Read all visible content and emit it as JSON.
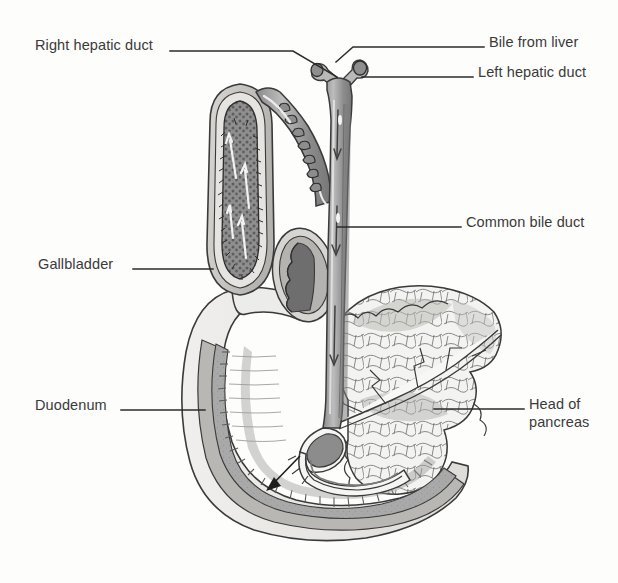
{
  "figure": {
    "style": "grayscale line-and-wash medical illustration",
    "background_color": "#fdfdfc",
    "ink_color": "#3a3a3a",
    "line_color": "#2b2b2b"
  },
  "labels": [
    {
      "id": "right-hepatic-duct",
      "text": "Right hepatic duct",
      "side": "left",
      "text_x": 35,
      "text_y": 36,
      "leader": "M 170 51 L 293 51 L 337 77"
    },
    {
      "id": "bile-from-liver",
      "text": "Bile from liver",
      "side": "right",
      "text_x": 489,
      "text_y": 33,
      "leader": "M 484 47 L 353 47 L 336 62"
    },
    {
      "id": "left-hepatic-duct",
      "text": "Left hepatic duct",
      "side": "right",
      "text_x": 478,
      "text_y": 63,
      "leader": "M 473 77 L 362 77"
    },
    {
      "id": "common-bile-duct",
      "text": "Common bile duct",
      "side": "right",
      "text_x": 466,
      "text_y": 213,
      "leader": "M 461 227 L 337 227"
    },
    {
      "id": "gallbladder",
      "text": "Gallbladder",
      "side": "left",
      "text_x": 38,
      "text_y": 255,
      "leader": "M 133 269 L 213 269"
    },
    {
      "id": "duodenum",
      "text": "Duodenum",
      "side": "left",
      "text_x": 35,
      "text_y": 396,
      "leader": "M 121 410 L 205 410"
    },
    {
      "id": "head-of-pancreas",
      "text": "Head of\npancreas",
      "side": "right",
      "text_x": 529,
      "text_y": 395,
      "leader": "M 524 409 L 434 409"
    }
  ],
  "structures": [
    {
      "id": "gallbladder-body",
      "name": "Gallbladder (cut open)"
    },
    {
      "id": "gallbladder-mucosa",
      "name": "Gallbladder mucosa"
    },
    {
      "id": "cystic-duct",
      "name": "Cystic duct with spiral valve"
    },
    {
      "id": "right-hepatic-duct-branch",
      "name": "Right hepatic duct"
    },
    {
      "id": "left-hepatic-duct-branch",
      "name": "Left hepatic duct"
    },
    {
      "id": "common-hepatic-duct",
      "name": "Common hepatic duct"
    },
    {
      "id": "common-bile-duct-tube",
      "name": "Common bile duct"
    },
    {
      "id": "duodenal-bulb-section",
      "name": "Duodenal bulb cross section"
    },
    {
      "id": "duodenum-loop",
      "name": "Duodenum C-loop"
    },
    {
      "id": "duodenal-mucosa",
      "name": "Duodenal mucosa with plicae circulares"
    },
    {
      "id": "pancreas",
      "name": "Pancreas (lobular)"
    },
    {
      "id": "pancreatic-duct",
      "name": "Pancreatic duct"
    },
    {
      "id": "ampulla-of-vater",
      "name": "Ampulla of Vater / hepatopancreatic ampulla"
    },
    {
      "id": "bile-flow-arrows",
      "name": "Bile flow direction arrows"
    }
  ]
}
